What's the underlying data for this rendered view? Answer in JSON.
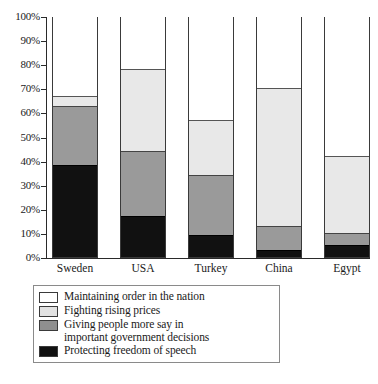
{
  "chart_data": {
    "type": "bar",
    "title": "",
    "subtitle": "",
    "xlabel": "",
    "ylabel": "",
    "stacked": true,
    "orientation": "vertical",
    "grid": false,
    "legend_position": "bottom-left",
    "ylim": [
      0,
      100
    ],
    "yticks": [
      "0%",
      "10%",
      "20%",
      "30%",
      "40%",
      "50%",
      "60%",
      "70%",
      "80%",
      "90%",
      "100%"
    ],
    "ytick_values": [
      0,
      10,
      20,
      30,
      40,
      50,
      60,
      70,
      80,
      90,
      100
    ],
    "categories": [
      "Sweden",
      "USA",
      "Turkey",
      "China",
      "Egypt"
    ],
    "series": [
      {
        "name": "Protecting freedom of speech",
        "color": "#111111",
        "values": [
          38,
          17,
          9,
          3,
          5
        ]
      },
      {
        "name": "Giving people more say in important government decisions",
        "color": "#9a9a9a",
        "values": [
          24.5,
          27,
          25,
          10,
          5
        ]
      },
      {
        "name": "Fighting rising prices",
        "color": "#e8e8e8",
        "values": [
          4.5,
          34,
          23,
          57,
          32
        ]
      },
      {
        "name": "Maintaining order in the nation",
        "color": "#ffffff",
        "values": [
          33,
          22,
          43,
          30,
          58
        ]
      }
    ]
  },
  "axis": {
    "yticks": [
      {
        "label": "100%",
        "value": 100
      },
      {
        "label": "90%",
        "value": 90
      },
      {
        "label": "80%",
        "value": 80
      },
      {
        "label": "70%",
        "value": 70
      },
      {
        "label": "60%",
        "value": 60
      },
      {
        "label": "50%",
        "value": 50
      },
      {
        "label": "40%",
        "value": 40
      },
      {
        "label": "30%",
        "value": 30
      },
      {
        "label": "20%",
        "value": 20
      },
      {
        "label": "10%",
        "value": 10
      },
      {
        "label": "0%",
        "value": 0
      }
    ]
  },
  "legend": {
    "items": [
      {
        "swatch": "sw-order",
        "line1": "Maintaining order in the nation",
        "line2": ""
      },
      {
        "swatch": "sw-prices",
        "line1": "Fighting rising prices",
        "line2": ""
      },
      {
        "swatch": "sw-say",
        "line1": "Giving people more say in",
        "line2": "important government decisions"
      },
      {
        "swatch": "sw-speech",
        "line1": "Protecting freedom of speech",
        "line2": ""
      }
    ]
  }
}
